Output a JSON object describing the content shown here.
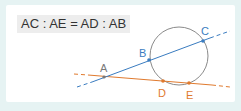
{
  "formula": "AC : AE = AD : AB",
  "colors": {
    "blue_line": "#3a7cc0",
    "orange_line": "#e07a2e",
    "circle": "#8a8a8a",
    "label_gray": "#7a7a7a",
    "background": "#e6f3f3"
  },
  "points": {
    "A": {
      "label": "A"
    },
    "B": {
      "label": "B"
    },
    "C": {
      "label": "C"
    },
    "D": {
      "label": "D"
    },
    "E": {
      "label": "E"
    }
  }
}
